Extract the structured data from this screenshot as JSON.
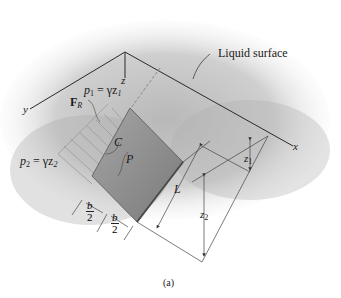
{
  "figure": {
    "caption": "(a)",
    "callout": "Liquid surface",
    "axes": {
      "x": "x",
      "y": "y",
      "z": "z"
    },
    "pressure_top": {
      "symbol": "p",
      "sub": "1",
      "eq": "= γz",
      "eq_sub": "1"
    },
    "pressure_bottom": {
      "symbol": "p",
      "sub": "2",
      "eq": "= γz",
      "eq_sub": "2"
    },
    "resultant_force": {
      "symbol": "F",
      "sub": "R"
    },
    "centroid": "C",
    "center_of_pressure": "P",
    "length": "L",
    "depth_1": {
      "symbol": "z",
      "sub": "1"
    },
    "depth_2": {
      "symbol": "z",
      "sub": "2"
    },
    "half_width": {
      "num": "b",
      "den": "2"
    }
  },
  "colors": {
    "line": "#2a2a2a",
    "plate": "#8a8a8a",
    "liquid": "#c9c9c9",
    "arrows": "#9a9a9a"
  }
}
